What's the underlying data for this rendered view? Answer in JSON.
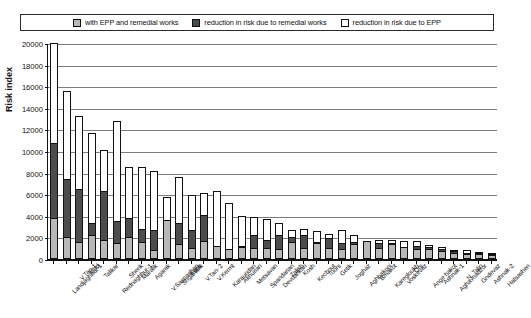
{
  "legend": {
    "entries": [
      {
        "label": "with EPP and remedial works",
        "icon": "square-grey-swatch",
        "color": "#b9b9b9"
      },
      {
        "label": "reduction in risk due to remedial works",
        "icon": "square-dark-swatch",
        "color": "#4a4a4a"
      },
      {
        "label": "reduction in risk due to EPP",
        "icon": "square-white-swatch",
        "color": "#ffffff"
      }
    ]
  },
  "chart_data": {
    "type": "bar",
    "subtype": "stacked",
    "title": "",
    "xlabel": "",
    "ylabel": "Risk index",
    "ylim": [
      0,
      20000
    ],
    "ytick_labels": [
      "0",
      "2000",
      "4000",
      "6000",
      "8000",
      "10000",
      "12000",
      "14000",
      "16000",
      "18000",
      "20000"
    ],
    "ytick_values": [
      0,
      2000,
      4000,
      6000,
      8000,
      10000,
      12000,
      14000,
      16000,
      18000,
      20000
    ],
    "grid": true,
    "legend_position": "top",
    "categories": [
      "Landjaghbur-1",
      "V.Tan-1",
      "Irind",
      "Talikar",
      "Rednaghbur-1",
      "Sherik",
      "Maralik",
      "Agarak",
      "V.Sasnashen",
      "Shgarshik",
      "Kaps",
      "V.Tan- 2",
      "V.Kermt",
      "Karaundan",
      "Akhurian",
      "Metsavan",
      "Spandarian",
      "Devdarikan",
      "Talish",
      "Kosh",
      "Kechout",
      "Toors",
      "Getik",
      "Joghaz",
      "Aghbakoni",
      "Bmakot",
      "Karegloukh",
      "Voskevaz",
      "Ors",
      "Ange hakot",
      "Ashnak-1",
      "Aghavnadzor",
      "N. Talin",
      "Gndevaz",
      "Ashnak-2",
      "Hatsashen"
    ],
    "series": [
      {
        "name": "with EPP and remedial works",
        "color": "#b8b8b8",
        "values": [
          3800,
          2000,
          1550,
          2250,
          1800,
          1500,
          2050,
          1600,
          820,
          3650,
          1350,
          1050,
          1700,
          1200,
          900,
          1100,
          1000,
          1000,
          900,
          1550,
          1000,
          1450,
          1000,
          900,
          1350,
          1700,
          1000,
          1350,
          1150,
          900,
          900,
          780,
          600,
          480,
          430,
          380
        ]
      },
      {
        "name": "reduction in risk due to remedial works",
        "color": "#4d4d4d",
        "values": [
          6900,
          5400,
          4950,
          1050,
          4500,
          2050,
          1750,
          1200,
          1900,
          0,
          1950,
          1600,
          2350,
          0,
          0,
          150,
          1250,
          800,
          1350,
          450,
          1250,
          150,
          950,
          600,
          200,
          0,
          450,
          100,
          0,
          350,
          250,
          120,
          80,
          100,
          120,
          60
        ]
      },
      {
        "name": "reduction in risk due to EPP",
        "color": "#ffffff",
        "values": [
          9300,
          8200,
          6700,
          8400,
          3750,
          9250,
          4750,
          5700,
          5400,
          2050,
          4300,
          3250,
          2050,
          5100,
          4300,
          2750,
          1600,
          1900,
          1100,
          700,
          500,
          1000,
          350,
          1200,
          700,
          0,
          350,
          300,
          500,
          400,
          150,
          200,
          150,
          200,
          100,
          80
        ]
      }
    ],
    "totals": [
      20000,
      15600,
      13200,
      11700,
      10050,
      12800,
      8550,
      8500,
      8120,
      5700,
      7600,
      5900,
      6100,
      6300,
      5200,
      4000,
      3850,
      3700,
      3350,
      2700,
      2750,
      2600,
      2300,
      2700,
      2250,
      1700,
      1800,
      1750,
      1650,
      1650,
      1300,
      1100,
      830,
      780,
      650,
      520
    ]
  }
}
